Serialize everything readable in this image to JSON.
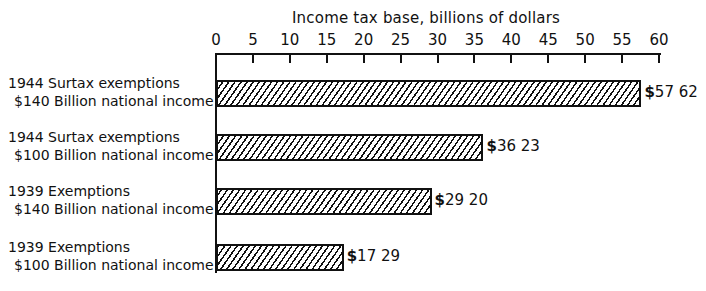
{
  "chart_data": {
    "type": "bar",
    "orientation": "horizontal",
    "title": "",
    "xlabel": "Income tax base, billions of dollars",
    "ylabel": "",
    "xlim": [
      0,
      60
    ],
    "xticks": [
      0,
      5,
      10,
      15,
      20,
      25,
      30,
      35,
      40,
      45,
      50,
      55,
      60
    ],
    "axis_position": "top",
    "grid": false,
    "legend": null,
    "categories": [
      {
        "line1": "1944 Surtax exemptions",
        "line2": "$140 Billion national income"
      },
      {
        "line1": "1944 Surtax exemptions",
        "line2": "$100 Billion national income"
      },
      {
        "line1": "1939 Exemptions",
        "line2": "$140 Billion national income"
      },
      {
        "line1": "1939 Exemptions",
        "line2": "$100 Billion national income"
      }
    ],
    "values": [
      57.62,
      36.23,
      29.2,
      17.29
    ],
    "value_labels": [
      "57 62",
      "36 23",
      "29 20",
      "17 29"
    ],
    "value_prefix": "$",
    "bar_fill": "diagonal-hatch",
    "colors": {
      "ink": "#111111",
      "background": "#ffffff"
    }
  }
}
